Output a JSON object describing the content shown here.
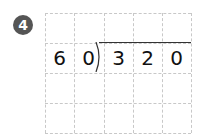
{
  "problem": {
    "number": "4",
    "divisor": [
      "6",
      "0"
    ],
    "dividend": [
      "3",
      "2",
      "0"
    ]
  },
  "grid": {
    "columns": 5,
    "rows": 4
  },
  "colors": {
    "badge": "#555555",
    "grid_line": "#c8c8c8",
    "text": "#111111"
  }
}
